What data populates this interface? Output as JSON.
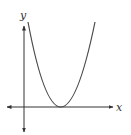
{
  "diagram": {
    "type": "parabola-graph",
    "colors": {
      "axis": "#333333",
      "curve": "#4a4a4a",
      "background": "#ffffff"
    },
    "axes": {
      "x_label": "x",
      "y_label": "y",
      "origin_px": [
        24,
        107
      ],
      "x_axis_px": {
        "x1": 7,
        "x2": 113,
        "y": 107
      },
      "y_axis_px": {
        "x": 24,
        "y1": 26,
        "y2": 132
      }
    },
    "curve": {
      "shape": "upward parabola tangent to x-axis",
      "left_top_px": [
        28,
        22
      ],
      "vertex_px": [
        60,
        107
      ],
      "right_top_px": [
        95,
        22
      ]
    }
  }
}
